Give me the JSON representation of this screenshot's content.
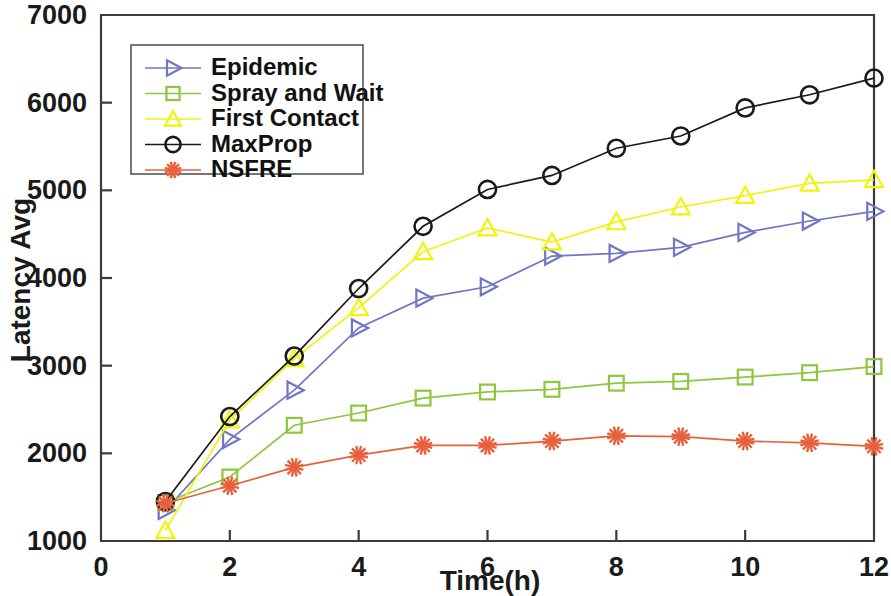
{
  "chart_data": {
    "type": "line",
    "title": "",
    "xlabel": "Time(h)",
    "ylabel": "Latency Avg",
    "xlim": [
      0,
      12
    ],
    "ylim": [
      1000,
      7000
    ],
    "xticks": [
      0,
      2,
      4,
      6,
      8,
      10,
      12
    ],
    "yticks": [
      1000,
      2000,
      3000,
      4000,
      5000,
      6000,
      7000
    ],
    "xtick_labels": [
      "0",
      "2",
      "4",
      "6",
      "8",
      "10",
      "12"
    ],
    "ytick_labels": [
      "1000",
      "2000",
      "3000",
      "4000",
      "5000",
      "6000",
      "7000"
    ],
    "grid": false,
    "legend_position": "upper left",
    "x": [
      1,
      2,
      3,
      4,
      5,
      6,
      7,
      8,
      9,
      10,
      11,
      12
    ],
    "series": [
      {
        "name": "Epidemic",
        "color": "#6f76c4",
        "marker": "right-triangle",
        "values": [
          1350,
          2160,
          2720,
          3430,
          3770,
          3900,
          4250,
          4280,
          4350,
          4520,
          4650,
          4760
        ]
      },
      {
        "name": "Spray and Wait",
        "color": "#8dc63f",
        "marker": "square",
        "values": [
          1440,
          1730,
          2320,
          2460,
          2630,
          2700,
          2730,
          2800,
          2820,
          2870,
          2920,
          2990
        ]
      },
      {
        "name": "First Contact",
        "color": "#f2f20d",
        "marker": "triangle",
        "values": [
          1120,
          2380,
          3080,
          3660,
          4300,
          4570,
          4410,
          4640,
          4810,
          4940,
          5080,
          5120
        ]
      },
      {
        "name": "MaxProp",
        "color": "#1a1a1a",
        "marker": "circle",
        "values": [
          1450,
          2420,
          3110,
          3880,
          4590,
          5010,
          5170,
          5480,
          5620,
          5940,
          6090,
          6280
        ]
      },
      {
        "name": "NSFRE",
        "color": "#e8603c",
        "marker": "asterisk",
        "values": [
          1430,
          1630,
          1840,
          1980,
          2090,
          2090,
          2140,
          2200,
          2190,
          2140,
          2120,
          2080
        ]
      }
    ]
  },
  "axes": {
    "y_title": "Latency Avg",
    "x_title": "Time(h)"
  },
  "legend": {
    "items": [
      {
        "label": "Epidemic"
      },
      {
        "label": "Spray and Wait"
      },
      {
        "label": "First Contact"
      },
      {
        "label": "MaxProp"
      },
      {
        "label": "NSFRE"
      }
    ]
  }
}
